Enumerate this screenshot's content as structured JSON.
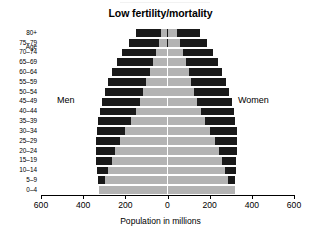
{
  "chart": {
    "title": "Low fertility/mortality",
    "xlabel": "Population in millions",
    "age_caption": "Age",
    "men_label": "Men",
    "women_label": "Women"
  },
  "chart_data": {
    "type": "bar",
    "subtype": "population-pyramid",
    "title": "Low fertility/mortality",
    "xlabel": "Population in millions",
    "ylabel": "Age",
    "xlim": [
      -600,
      600
    ],
    "xticks": [
      -600,
      -400,
      -200,
      0,
      200,
      400,
      600
    ],
    "xtick_labels": [
      "600",
      "400",
      "200",
      "0",
      "200",
      "400",
      "600"
    ],
    "grid": false,
    "legend": "inline-annotations",
    "categories": [
      "80+",
      "75–79",
      "70–74",
      "65–69",
      "60–64",
      "55–59",
      "50–54",
      "45–49",
      "40–44",
      "35–39",
      "30–34",
      "25–29",
      "20–24",
      "15–19",
      "10–14",
      "5–9",
      "0–4"
    ],
    "colors": {
      "inner": "#b3b3b3",
      "outer": "#1a1a1a",
      "axis": "#000000",
      "background": "#ffffff"
    },
    "series": [
      {
        "name": "Men",
        "side": "left",
        "inner_values": [
          30,
          40,
          55,
          70,
          85,
          100,
          115,
          130,
          150,
          175,
          200,
          225,
          250,
          265,
          280,
          295,
          325
        ],
        "outer_values": [
          150,
          185,
          215,
          240,
          262,
          280,
          296,
          310,
          322,
          330,
          336,
          340,
          341,
          338,
          335,
          330,
          325
        ]
      },
      {
        "name": "Women",
        "side": "right",
        "inner_values": [
          45,
          58,
          72,
          86,
          100,
          113,
          126,
          140,
          158,
          180,
          202,
          224,
          244,
          258,
          272,
          288,
          318
        ],
        "outer_values": [
          155,
          188,
          216,
          240,
          260,
          277,
          292,
          305,
          315,
          322,
          328,
          330,
          330,
          327,
          324,
          320,
          318
        ]
      }
    ]
  }
}
